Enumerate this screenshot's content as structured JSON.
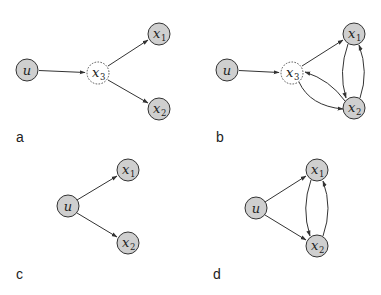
{
  "figure": {
    "panels": [
      {
        "label": "a",
        "nodes": [
          {
            "id": "u",
            "text": "u",
            "sub": "",
            "style": "solid"
          },
          {
            "id": "x3",
            "text": "x",
            "sub": "3",
            "style": "dashed"
          },
          {
            "id": "x1",
            "text": "x",
            "sub": "1",
            "style": "solid"
          },
          {
            "id": "x2",
            "text": "x",
            "sub": "2",
            "style": "solid"
          }
        ],
        "edges": [
          {
            "from": "u",
            "to": "x3"
          },
          {
            "from": "x3",
            "to": "x1"
          },
          {
            "from": "x3",
            "to": "x2"
          }
        ]
      },
      {
        "label": "b",
        "nodes": [
          {
            "id": "u",
            "text": "u",
            "sub": "",
            "style": "solid"
          },
          {
            "id": "x3",
            "text": "x",
            "sub": "3",
            "style": "dashed"
          },
          {
            "id": "x1",
            "text": "x",
            "sub": "1",
            "style": "solid"
          },
          {
            "id": "x2",
            "text": "x",
            "sub": "2",
            "style": "solid"
          }
        ],
        "edges": [
          {
            "from": "u",
            "to": "x3"
          },
          {
            "from": "x3",
            "to": "x1"
          },
          {
            "from": "x3",
            "to": "x2"
          },
          {
            "from": "x2",
            "to": "x3"
          },
          {
            "from": "x1",
            "to": "x2"
          },
          {
            "from": "x2",
            "to": "x1"
          }
        ]
      },
      {
        "label": "c",
        "nodes": [
          {
            "id": "u",
            "text": "u",
            "sub": "",
            "style": "solid"
          },
          {
            "id": "x1",
            "text": "x",
            "sub": "1",
            "style": "solid"
          },
          {
            "id": "x2",
            "text": "x",
            "sub": "2",
            "style": "solid"
          }
        ],
        "edges": [
          {
            "from": "u",
            "to": "x1"
          },
          {
            "from": "u",
            "to": "x2"
          }
        ]
      },
      {
        "label": "d",
        "nodes": [
          {
            "id": "u",
            "text": "u",
            "sub": "",
            "style": "solid"
          },
          {
            "id": "x1",
            "text": "x",
            "sub": "1",
            "style": "solid"
          },
          {
            "id": "x2",
            "text": "x",
            "sub": "2",
            "style": "solid"
          }
        ],
        "edges": [
          {
            "from": "u",
            "to": "x1"
          },
          {
            "from": "u",
            "to": "x2"
          },
          {
            "from": "x1",
            "to": "x2"
          },
          {
            "from": "x2",
            "to": "x1"
          }
        ]
      }
    ],
    "colors": {
      "node_fill": "#cfcfcf",
      "stroke": "#333333",
      "latent_fill": "#ffffff"
    }
  }
}
